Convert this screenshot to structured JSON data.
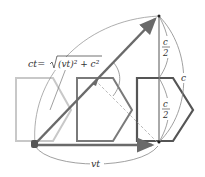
{
  "diagram": {
    "labels": {
      "hypotenuse": "ct=√(vt)²+c²",
      "hyp_lhs": "ct=",
      "hyp_rhs": "(vt)² + c²",
      "half_top_num": "c",
      "half_top_den": "2",
      "half_bot_num": "c",
      "half_bot_den": "2",
      "full_height": "c",
      "base": "vt"
    },
    "colors": {
      "ghost_shape": "#c8c8c8",
      "middle_shape": "#7a7a7a",
      "front_shape": "#555555",
      "arrow": "#6a6a6a",
      "thin_line": "#888888"
    },
    "points": {
      "origin": [
        35,
        144
      ],
      "top": [
        159,
        16
      ],
      "base_end": [
        158,
        145
      ]
    }
  }
}
